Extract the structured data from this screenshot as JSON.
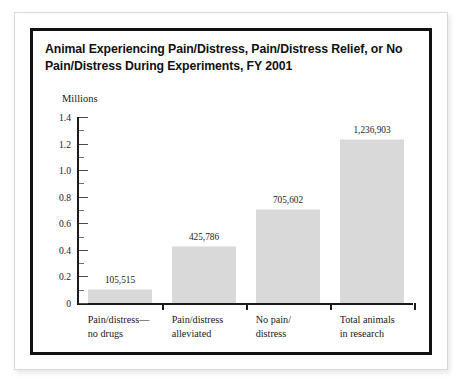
{
  "title": "Animal Experiencing Pain/Distress, Pain/Distress Relief, or No Pain/Distress During Experiments, FY 2001",
  "chart_data": {
    "type": "bar",
    "title": "Animal Experiencing Pain/Distress, Pain/Distress Relief, or No Pain/Distress During Experiments, FY 2001",
    "xlabel": "",
    "ylabel": "Millions",
    "unit_note": "Millions",
    "ylim": [
      0,
      1.4
    ],
    "ytick_labels": [
      "0",
      "0.2",
      "0.4",
      "0.6",
      "0.8",
      "1.0",
      "1.2",
      "1.4"
    ],
    "ytick_values": [
      0,
      0.2,
      0.4,
      0.6,
      0.8,
      1.0,
      1.2,
      1.4
    ],
    "minor_ticks": [
      0.1,
      0.3,
      0.5,
      0.7,
      0.9,
      1.1,
      1.3
    ],
    "grid": false,
    "legend": "none",
    "bar_color": "#d9d9d9",
    "categories": [
      "Pain/distress—\nno drugs",
      "Pain/distress\nalleviated",
      "No pain/\ndistress",
      "Total animals\nin research"
    ],
    "values": [
      105515,
      425786,
      705602,
      1236903
    ],
    "values_millions": [
      0.105515,
      0.425786,
      0.705602,
      1.236903
    ],
    "data_labels": [
      "105,515",
      "425,786",
      "705,602",
      "1,236,903"
    ]
  }
}
